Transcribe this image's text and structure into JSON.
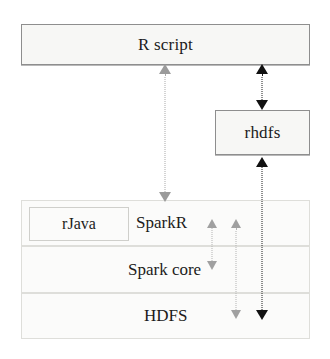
{
  "diagram": {
    "title_nodes": {
      "r_script": "R script",
      "rhdfs": "rhdfs",
      "rjava": "rJava",
      "sparkr": "SparkR",
      "spark_core": "Spark core",
      "hdfs": "HDFS"
    },
    "colors": {
      "node_fill": "#f7f7f5",
      "node_border_strong": "#8e8e8e",
      "node_border_faint": "#dcdcd8",
      "text": "#1b1b1b",
      "connector_gray": "#9b9b9b",
      "connector_black": "#111111",
      "canvas": "#ffffff"
    },
    "connectors": [
      {
        "name": "r-script-to-sparkr",
        "style": "dotted",
        "color": "#9b9b9b",
        "arrowheads": "both",
        "from": "R script",
        "to": "SparkR"
      },
      {
        "name": "r-script-to-rhdfs",
        "style": "dotted",
        "color": "#111111",
        "arrowheads": "both",
        "from": "R script",
        "to": "rhdfs"
      },
      {
        "name": "rhdfs-to-hdfs",
        "style": "dotted",
        "color": "#111111",
        "arrowheads": "both",
        "from": "rhdfs",
        "to": "HDFS"
      },
      {
        "name": "sparkr-to-spark-core",
        "style": "dotted",
        "color": "#9b9b9b",
        "arrowheads": "both",
        "from": "SparkR",
        "to": "Spark core"
      },
      {
        "name": "sparkr-to-hdfs",
        "style": "dotted",
        "color": "#9b9b9b",
        "arrowheads": "both",
        "from": "SparkR",
        "to": "HDFS"
      }
    ]
  }
}
